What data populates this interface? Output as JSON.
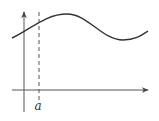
{
  "diagram": {
    "width": 159,
    "height": 121,
    "stroke_color": "#333333",
    "axis_color": "#555555",
    "background": "#ffffff",
    "x_axis": {
      "y": 90,
      "x_start": 12,
      "x_end": 148
    },
    "y_axis": {
      "x": 24,
      "y_start": 112,
      "y_end": 12
    },
    "dashed_line": {
      "x": 39,
      "y_top": 12,
      "y_bottom": 100,
      "label": "a",
      "label_x": 38,
      "label_y": 106
    },
    "curve_path": "M 12 38 C 30 30, 45 14, 67 14 C 88 14, 102 40, 123 40 C 136 40, 142 35, 148 31"
  }
}
